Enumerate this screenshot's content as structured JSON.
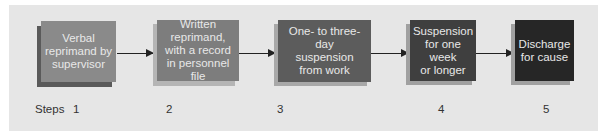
{
  "diagram": {
    "type": "flowchart",
    "background_color": "#e6e6e6",
    "steps_label": "Steps",
    "boxes": [
      {
        "step": "1",
        "text": "Verbal reprimand by supervisor",
        "color": "#8a8a8a"
      },
      {
        "step": "2",
        "text": "Written reprimand, with a record in personnel file",
        "color": "#7d7d7d"
      },
      {
        "step": "3",
        "text": "One- to three-day suspension from work",
        "color": "#5c5c5c"
      },
      {
        "step": "4",
        "text": "Suspension for one week or longer",
        "color": "#3f3f3f"
      },
      {
        "step": "5",
        "text": "Discharge for cause",
        "color": "#262626"
      }
    ],
    "lines": {
      "b1": [
        "Verbal",
        "reprimand by",
        "supervisor"
      ],
      "b2": [
        "Written",
        "reprimand,",
        "with a record",
        "in personnel file"
      ],
      "b3": [
        "One- to three-day",
        "suspension",
        "from work"
      ],
      "b4": [
        "Suspension",
        "for one week",
        "or longer"
      ],
      "b5": [
        "Discharge",
        "for cause"
      ]
    }
  }
}
